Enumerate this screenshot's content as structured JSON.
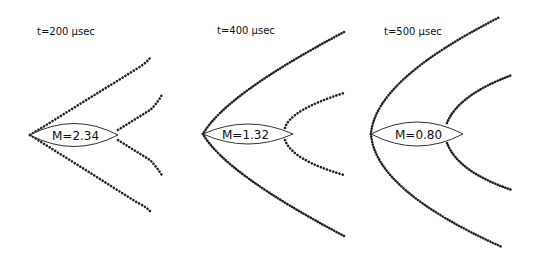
{
  "figure": {
    "panels": [
      {
        "time_label": "t=200 μsec",
        "mach_label": "M=2.34"
      },
      {
        "time_label": "t=400 μsec",
        "mach_label": "M=1.32"
      },
      {
        "time_label": "t=500 μsec",
        "mach_label": "M=0.80"
      }
    ],
    "colors": {
      "shock_dots": "#222222",
      "lens_outline": "#333333",
      "background": "#ffffff"
    }
  }
}
